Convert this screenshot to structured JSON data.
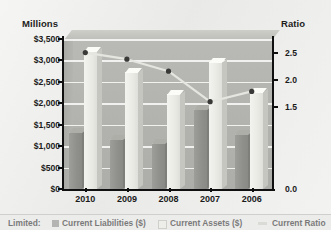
{
  "chart_data": {
    "type": "bar",
    "title": "",
    "subtitle": "",
    "categories": [
      "2010",
      "2009",
      "2008",
      "2007",
      "2006"
    ],
    "xlabel": "",
    "ylabel": "Millions",
    "y2label": "Ratio",
    "ylim": [
      0,
      3500
    ],
    "y2lim": [
      0.0,
      2.75
    ],
    "grid": true,
    "legend_position": "bottom",
    "y_ticks": [
      "$0",
      "$500",
      "$1,000",
      "$1,500",
      "$2,000",
      "$2,500",
      "$3,000",
      "$3,500"
    ],
    "y2_ticks": [
      "0.0",
      "1.5",
      "2.0",
      "2.5"
    ],
    "series": [
      {
        "name": "Current Liabilities ($)",
        "type": "bar",
        "axis": "left",
        "color": "#90908c",
        "values": [
          1300,
          1150,
          1050,
          1850,
          1250
        ]
      },
      {
        "name": "Current Assets ($)",
        "type": "bar",
        "axis": "left",
        "color": "#eeeee9",
        "values": [
          3200,
          2700,
          2200,
          2950,
          2250
        ]
      },
      {
        "name": "Current Ratio",
        "type": "line",
        "axis": "right",
        "color": "#e6e6e1",
        "values": [
          2.5,
          2.38,
          2.16,
          1.6,
          1.79
        ]
      }
    ]
  },
  "axes": {
    "left_title": "Millions",
    "right_title": "Ratio"
  },
  "legend": {
    "prefix": "Limited:",
    "items": [
      {
        "label": "Current Liabilities ($)"
      },
      {
        "label": "Current Assets ($)"
      },
      {
        "label": "Current Ratio"
      }
    ]
  }
}
